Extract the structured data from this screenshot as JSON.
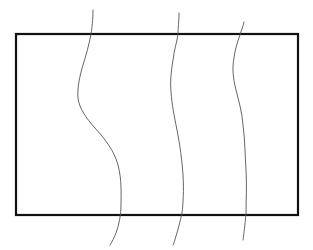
{
  "diagram": {
    "background": "#ffffff",
    "rectangle": {
      "x": 16,
      "y": 34,
      "width": 282,
      "height": 181,
      "stroke": "#111111",
      "stroke_width": 2.2
    },
    "curves": [
      {
        "id": "curve-1",
        "stroke": "#555555",
        "stroke_width": 0.9,
        "path": "M93,10 C93,20 92,28 91,34 C89,45 86,55 83,65 C80,75 77,88 78,98 C79,108 86,118 95,128 C104,138 114,150 118,165 C122,180 121,195 121,205 C121,215 119,225 116,233 C114,238 112,242 110,245"
      },
      {
        "id": "curve-2",
        "stroke": "#555555",
        "stroke_width": 0.9,
        "path": "M179,13 C179,22 178,28 178,34 C177,42 174,50 173,60 C171,72 170,82 171,92 C172,105 174,115 177,130 C180,145 182,160 183,175 C184,190 183,205 182,213 C180,222 178,230 176,236 C175,240 174,243 173,245"
      },
      {
        "id": "curve-3",
        "stroke": "#555555",
        "stroke_width": 0.9,
        "path": "M244,22 C243,27 241,31 240,35 C237,43 235,50 234,58 C232,68 233,78 236,90 C239,102 242,112 243,125 C245,140 245,155 246,170 C247,185 246,200 246,213 C245,225 244,233 243,240"
      }
    ]
  }
}
